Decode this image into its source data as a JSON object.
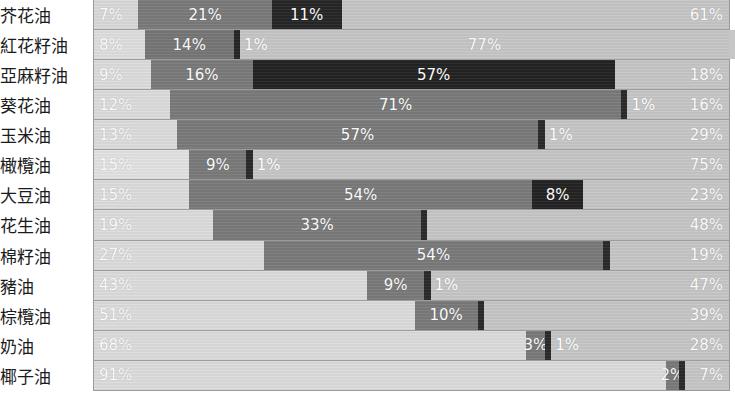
{
  "chart_data": {
    "type": "bar",
    "subtype": "stacked-horizontal-100-percent",
    "title": "",
    "subtitle": "",
    "xlabel": "",
    "ylabel": "",
    "xlim": [
      0,
      100
    ],
    "grid": false,
    "legend_position": "none",
    "value_suffix": "%",
    "orientation": "horizontal",
    "stack_total": 100,
    "categories": [
      "芥花油",
      "紅花籽油",
      "亞麻籽油",
      "葵花油",
      "玉米油",
      "橄欖油",
      "大豆油",
      "花生油",
      "棉籽油",
      "豬油",
      "棕欖油",
      "奶油",
      "椰子油"
    ],
    "series": [
      {
        "name": "series-1",
        "color": "#d9d9d9",
        "values": [
          7,
          8,
          9,
          12,
          13,
          15,
          15,
          19,
          27,
          43,
          51,
          68,
          91
        ]
      },
      {
        "name": "series-2",
        "color": "#777777",
        "values": [
          21,
          14,
          16,
          71,
          57,
          9,
          54,
          33,
          54,
          9,
          10,
          3,
          2
        ]
      },
      {
        "name": "series-3",
        "color": "#262626",
        "values": [
          11,
          1,
          57,
          1,
          1,
          1,
          8,
          0,
          0,
          1,
          0,
          1,
          0
        ]
      },
      {
        "name": "series-4",
        "color": "#c4c4c4",
        "values": [
          61,
          77,
          18,
          16,
          29,
          75,
          23,
          48,
          19,
          47,
          39,
          28,
          7
        ]
      }
    ],
    "rows": [
      {
        "label": "芥花油",
        "segments": [
          {
            "value": 7,
            "text": "7%",
            "color": "#d9d9d9",
            "show_label": true
          },
          {
            "value": 21,
            "text": "21%",
            "color": "#7a7a7a",
            "show_label": true
          },
          {
            "value": 11,
            "text": "11%",
            "color": "#262626",
            "show_label": true
          },
          {
            "value": 61,
            "text": "61%",
            "color": "#c6c6c6",
            "show_label": true
          }
        ]
      },
      {
        "label": "紅花籽油",
        "segments": [
          {
            "value": 8,
            "text": "8%",
            "color": "#dedede",
            "show_label": true
          },
          {
            "value": 14,
            "text": "14%",
            "color": "#767676",
            "show_label": true
          },
          {
            "value": 1,
            "text": "1%",
            "color": "#262626",
            "show_label": false
          },
          {
            "value": 77,
            "text": "77%",
            "color": "#c6c6c6",
            "show_label": true
          },
          {
            "value": 0,
            "text": "1%",
            "color": "#c6c6c6",
            "show_label": false
          }
        ]
      },
      {
        "label": "亞麻籽油",
        "segments": [
          {
            "value": 9,
            "text": "9%",
            "color": "#dcdcdc",
            "show_label": true
          },
          {
            "value": 16,
            "text": "16%",
            "color": "#7a7a7a",
            "show_label": true
          },
          {
            "value": 57,
            "text": "57%",
            "color": "#232323",
            "show_label": true
          },
          {
            "value": 18,
            "text": "18%",
            "color": "#c6c6c6",
            "show_label": true
          }
        ]
      },
      {
        "label": "葵花油",
        "segments": [
          {
            "value": 12,
            "text": "12%",
            "color": "#dcdcdc",
            "show_label": true
          },
          {
            "value": 71,
            "text": "71%",
            "color": "#7a7a7a",
            "show_label": true
          },
          {
            "value": 1,
            "text": "1%",
            "color": "#2a2a2a",
            "show_label": false
          },
          {
            "value": 16,
            "text": "16%",
            "color": "#c6c6c6",
            "show_label": true
          }
        ]
      },
      {
        "label": "玉米油",
        "segments": [
          {
            "value": 13,
            "text": "13%",
            "color": "#dcdcdc",
            "show_label": true
          },
          {
            "value": 57,
            "text": "57%",
            "color": "#7a7a7a",
            "show_label": true
          },
          {
            "value": 1,
            "text": "1%",
            "color": "#2a2a2a",
            "show_label": false
          },
          {
            "value": 29,
            "text": "29%",
            "color": "#c6c6c6",
            "show_label": true
          }
        ]
      },
      {
        "label": "橄欖油",
        "segments": [
          {
            "value": 15,
            "text": "15%",
            "color": "#e2e2e2",
            "show_label": true
          },
          {
            "value": 9,
            "text": "9%",
            "color": "#7a7a7a",
            "show_label": true
          },
          {
            "value": 1,
            "text": "1%",
            "color": "#2a2a2a",
            "show_label": false
          },
          {
            "value": 75,
            "text": "75%",
            "color": "#c6c6c6",
            "show_label": true
          }
        ]
      },
      {
        "label": "大豆油",
        "segments": [
          {
            "value": 15,
            "text": "15%",
            "color": "#dcdcdc",
            "show_label": true
          },
          {
            "value": 54,
            "text": "54%",
            "color": "#7a7a7a",
            "show_label": true
          },
          {
            "value": 8,
            "text": "8%",
            "color": "#232323",
            "show_label": true
          },
          {
            "value": 23,
            "text": "23%",
            "color": "#c6c6c6",
            "show_label": true
          }
        ]
      },
      {
        "label": "花生油",
        "segments": [
          {
            "value": 19,
            "text": "19%",
            "color": "#dcdcdc",
            "show_label": true
          },
          {
            "value": 33,
            "text": "33%",
            "color": "#7a7a7a",
            "show_label": true
          },
          {
            "value": 1,
            "text": "",
            "color": "#2a2a2a",
            "show_label": false
          },
          {
            "value": 48,
            "text": "48%",
            "color": "#c6c6c6",
            "show_label": true
          }
        ]
      },
      {
        "label": "棉籽油",
        "segments": [
          {
            "value": 27,
            "text": "27%",
            "color": "#dcdcdc",
            "show_label": true
          },
          {
            "value": 54,
            "text": "54%",
            "color": "#7a7a7a",
            "show_label": true
          },
          {
            "value": 1,
            "text": "",
            "color": "#2a2a2a",
            "show_label": false
          },
          {
            "value": 19,
            "text": "19%",
            "color": "#c6c6c6",
            "show_label": true
          }
        ]
      },
      {
        "label": "豬油",
        "segments": [
          {
            "value": 43,
            "text": "43%",
            "color": "#dcdcdc",
            "show_label": true
          },
          {
            "value": 9,
            "text": "9%",
            "color": "#7a7a7a",
            "show_label": true
          },
          {
            "value": 1,
            "text": "1%",
            "color": "#2a2a2a",
            "show_label": false
          },
          {
            "value": 47,
            "text": "47%",
            "color": "#c6c6c6",
            "show_label": true
          }
        ]
      },
      {
        "label": "棕欖油",
        "segments": [
          {
            "value": 51,
            "text": "51%",
            "color": "#dcdcdc",
            "show_label": true
          },
          {
            "value": 10,
            "text": "10%",
            "color": "#7a7a7a",
            "show_label": true
          },
          {
            "value": 1,
            "text": "",
            "color": "#2a2a2a",
            "show_label": false
          },
          {
            "value": 39,
            "text": "39%",
            "color": "#c6c6c6",
            "show_label": true
          }
        ]
      },
      {
        "label": "奶油",
        "segments": [
          {
            "value": 68,
            "text": "68%",
            "color": "#dcdcdc",
            "show_label": true
          },
          {
            "value": 3,
            "text": "3%",
            "color": "#7a7a7a",
            "show_label": true
          },
          {
            "value": 1,
            "text": "1%",
            "color": "#2a2a2a",
            "show_label": false
          },
          {
            "value": 28,
            "text": "28%",
            "color": "#c6c6c6",
            "show_label": true
          }
        ]
      },
      {
        "label": "椰子油",
        "segments": [
          {
            "value": 91,
            "text": "91%",
            "color": "#dcdcdc",
            "show_label": true
          },
          {
            "value": 2,
            "text": "2%",
            "color": "#7a7a7a",
            "show_label": true
          },
          {
            "value": 1,
            "text": "",
            "color": "#2a2a2a",
            "show_label": false
          },
          {
            "value": 7,
            "text": "7%",
            "color": "#c6c6c6",
            "show_label": true
          }
        ]
      }
    ],
    "inline_extra_labels": [
      {
        "row": "紅花籽油",
        "text": "1%"
      },
      {
        "row": "葵花油",
        "text": "1%"
      },
      {
        "row": "玉米油",
        "text": "1%"
      },
      {
        "row": "橄欖油",
        "text": "1%"
      },
      {
        "row": "豬油",
        "text": "1%"
      },
      {
        "row": "奶油",
        "text": "1%"
      }
    ]
  }
}
